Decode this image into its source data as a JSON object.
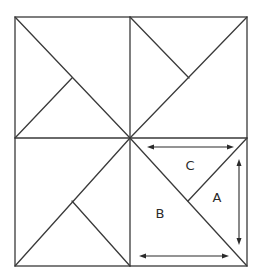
{
  "diagram": {
    "title": "",
    "type": "square-dissection",
    "stroke_color": "#3a3a3a",
    "outer_square": {
      "x1": 15,
      "y1": 17,
      "x2": 247,
      "y2": 266
    },
    "center": {
      "x": 130,
      "y": 138
    },
    "labels": {
      "a": {
        "text": "A",
        "x": 217,
        "y": 198
      },
      "b": {
        "text": "B",
        "x": 160,
        "y": 214
      },
      "c": {
        "text": "C",
        "x": 190,
        "y": 166
      }
    },
    "arrows": [
      {
        "id": "top-horizontal",
        "orientation": "horizontal",
        "double_headed": true,
        "from": [
          148,
          147
        ],
        "to": [
          233,
          147
        ]
      },
      {
        "id": "right-vertical",
        "orientation": "vertical",
        "double_headed": true,
        "from": [
          239,
          160
        ],
        "to": [
          239,
          244
        ]
      },
      {
        "id": "bottom-horizontal",
        "orientation": "horizontal",
        "double_headed": true,
        "from": [
          140,
          256
        ],
        "to": [
          228,
          256
        ]
      }
    ]
  }
}
